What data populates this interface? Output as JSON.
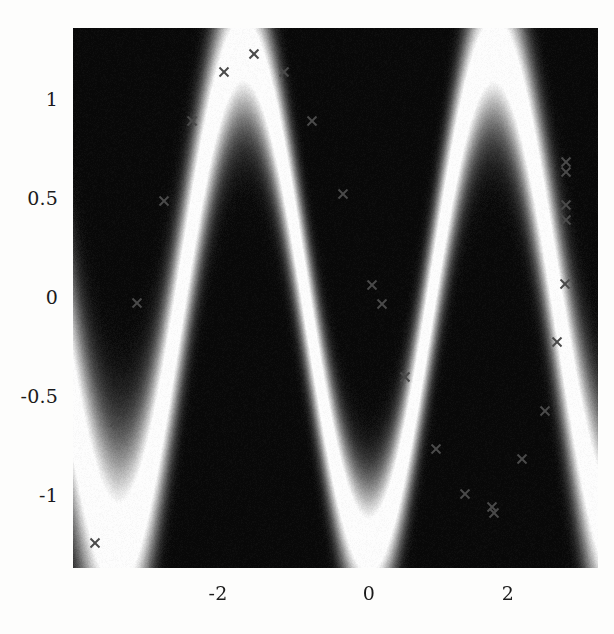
{
  "figure": {
    "kind": "predictive-density-heatmap",
    "colormap": "grayscale-inverted",
    "background_color": "#fdfdfc",
    "plot_box": {
      "left": 73,
      "top": 28,
      "width": 525,
      "height": 540
    },
    "border": "none"
  },
  "axes": {
    "x": {
      "tick_labels": [
        "-2",
        "0",
        "2"
      ],
      "tick_values": [
        -2,
        0,
        2
      ],
      "tick_pixels": [
        218,
        369,
        508
      ],
      "range": [
        -3.9,
        3.2
      ],
      "label": ""
    },
    "y": {
      "tick_labels": [
        "1",
        "0.5",
        "0",
        "-0.5",
        "-1"
      ],
      "tick_values": [
        1,
        0.5,
        0,
        -0.5,
        -1
      ],
      "tick_pixels": [
        100,
        199,
        298,
        397,
        496
      ],
      "range": [
        -1.36,
        1.36
      ],
      "label": ""
    }
  },
  "chart_data": {
    "type": "heatmap",
    "title": "",
    "xlabel": "",
    "ylabel": "",
    "xlim": [
      -3.9,
      3.2
    ],
    "ylim": [
      -1.36,
      1.36
    ],
    "grid": false,
    "legend": "none",
    "colorbar": false,
    "color_low": "#000000",
    "color_high": "#ffffff",
    "density_model": {
      "mean_function": "1.25*sin(1.85*(x+1.6)+1.5708)",
      "amplitude": 1.25,
      "period": 3.4,
      "phase_peak_x": -1.6,
      "phase_trough_x": 1.7,
      "sigma_base": 0.165,
      "sigma_growth_outward": 0.11,
      "noise_grain": 0.055
    },
    "markers": {
      "style": "x",
      "color": "#4a4a4a",
      "size": 9,
      "count": 25,
      "x": [
        -3.52,
        -3.14,
        -2.88,
        -2.63,
        -2.25,
        -1.92,
        -1.55,
        -1.18,
        -0.8,
        -0.42,
        -0.05,
        0.13,
        0.48,
        0.85,
        1.2,
        1.55,
        1.7,
        1.92,
        2.1,
        2.4,
        2.55,
        2.72,
        2.78,
        2.82,
        2.88
      ],
      "y": [
        -1.25,
        -0.62,
        -0.02,
        0.5,
        0.9,
        1.16,
        1.25,
        1.16,
        0.9,
        0.52,
        0.07,
        -0.03,
        -0.39,
        -0.75,
        -1.02,
        -1.05,
        -1.08,
        -0.79,
        -0.65,
        -0.27,
        0.05,
        0.4,
        0.45,
        0.58,
        0.62
      ],
      "pixels": [
        {
          "px": 95,
          "py": 543
        },
        {
          "px": 115,
          "py": 422
        },
        {
          "px": 137,
          "py": 303
        },
        {
          "px": 164,
          "py": 201
        },
        {
          "px": 192,
          "py": 121
        },
        {
          "px": 224,
          "py": 72
        },
        {
          "px": 254,
          "py": 54
        },
        {
          "px": 284,
          "py": 72
        },
        {
          "px": 312,
          "py": 121
        },
        {
          "px": 343,
          "py": 194
        },
        {
          "px": 372,
          "py": 285
        },
        {
          "px": 382,
          "py": 304
        },
        {
          "px": 405,
          "py": 377
        },
        {
          "px": 436,
          "py": 449
        },
        {
          "px": 465,
          "py": 494
        },
        {
          "px": 492,
          "py": 507
        },
        {
          "px": 494,
          "py": 513
        },
        {
          "px": 522,
          "py": 459
        },
        {
          "px": 545,
          "py": 411
        },
        {
          "px": 557,
          "py": 342
        },
        {
          "px": 565,
          "py": 284
        },
        {
          "px": 566,
          "py": 220
        },
        {
          "px": 566,
          "py": 205
        },
        {
          "px": 566,
          "py": 172
        },
        {
          "px": 566,
          "py": 162
        }
      ]
    }
  }
}
